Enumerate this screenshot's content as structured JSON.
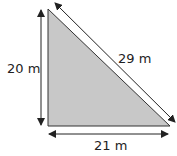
{
  "diagram": {
    "type": "right-triangle",
    "fill_color": "#c8c8c8",
    "stroke_color": "#333333",
    "labels": {
      "height": "20 m",
      "hypotenuse": "29 m",
      "base": "21 m"
    },
    "sides": {
      "height_m": 20,
      "base_m": 21,
      "hypotenuse_m": 29
    }
  }
}
